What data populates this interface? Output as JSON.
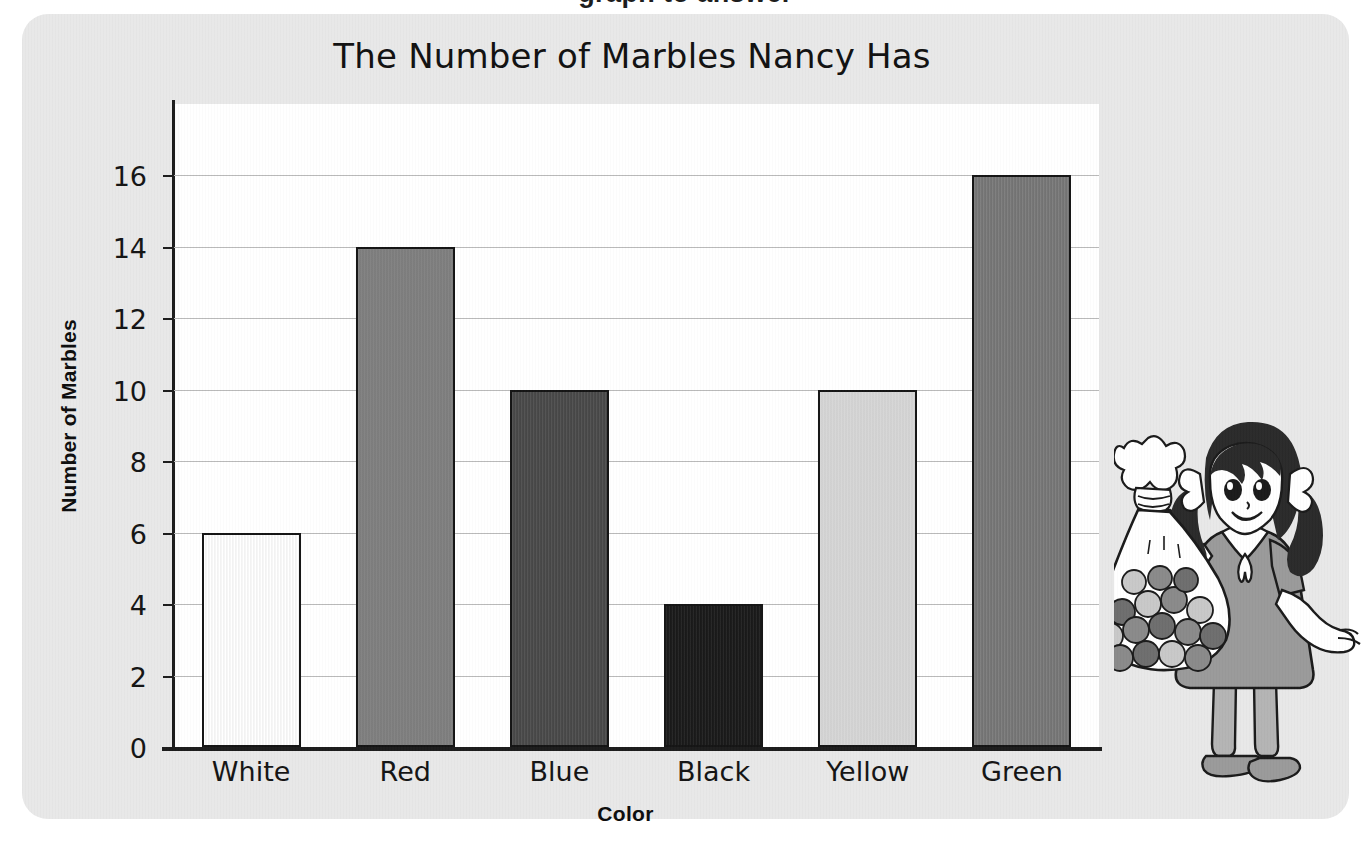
{
  "cut_off_heading_fragment": "graph to answer",
  "card": {
    "background_color": "#e8e8e8"
  },
  "chart_data": {
    "type": "bar",
    "title": "The Number of Marbles Nancy Has",
    "xlabel": "Color",
    "ylabel": "Number of Marbles",
    "categories": [
      "White",
      "Red",
      "Blue",
      "Black",
      "Yellow",
      "Green"
    ],
    "values": [
      6,
      14,
      10,
      4,
      10,
      16
    ],
    "ylim": [
      0,
      18
    ],
    "ytick_labels": [
      "0",
      "2",
      "4",
      "6",
      "8",
      "10",
      "12",
      "14",
      "16"
    ],
    "ytick_values": [
      0,
      2,
      4,
      6,
      8,
      10,
      12,
      16
    ],
    "grid": true,
    "legend": "none",
    "bar_colors": [
      "#ffffff",
      "#808080",
      "#4a4a4a",
      "#1a1a1a",
      "#d8d8d8",
      "#787878"
    ],
    "bar_edge_color": "#141414",
    "gridline_color": "#b9b9b9",
    "axis_color": "#1c1c1c",
    "plot_background": "#ffffff"
  },
  "illustration": {
    "name": "girl-holding-bag-of-marbles",
    "hair_color": "#2a2a2a",
    "dress_color": "#9a9a9a",
    "skin_color": "#ffffff",
    "marble_color": "#8e8e8e"
  }
}
